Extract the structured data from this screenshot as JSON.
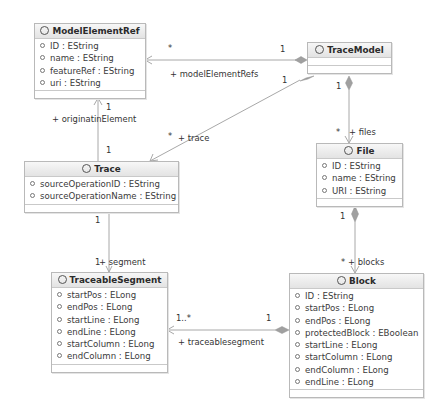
{
  "classes": {
    "modelElementRef": {
      "name": "ModelElementRef",
      "attributes": [
        "ID : EString",
        "name : EString",
        "featureRef : EString",
        "uri : EString"
      ]
    },
    "traceModel": {
      "name": "TraceModel",
      "attributes": []
    },
    "trace": {
      "name": "Trace",
      "attributes": [
        "sourceOperationID : EString",
        "sourceOperationName : EString"
      ]
    },
    "file": {
      "name": "File",
      "attributes": [
        "ID : EString",
        "name : EString",
        "URI : EString"
      ]
    },
    "traceableSegment": {
      "name": "TraceableSegment",
      "attributes": [
        "startPos : ELong",
        "endPos : ELong",
        "startLine : ELong",
        "endLine : ELong",
        "startColumn : ELong",
        "endColumn : ELong"
      ]
    },
    "block": {
      "name": "Block",
      "attributes": [
        "ID : EString",
        "startPos : ELong",
        "endPos : ELong",
        "protectedBlock : EBoolean",
        "startLine : ELong",
        "startColumn : ELong",
        "endColumn : ELong",
        "endLine : ELong"
      ]
    }
  },
  "associations": {
    "modelElementRefs": {
      "role": "+ modelElementRefs",
      "source_mult": "1",
      "target_mult": "*"
    },
    "trace": {
      "role": "+ trace",
      "source_mult": "1",
      "target_mult": "*"
    },
    "files": {
      "role": "+ files",
      "source_mult": "1",
      "target_mult": "*"
    },
    "originatinElement": {
      "role": "+ originatinElement",
      "source_mult": "1",
      "target_mult": "1"
    },
    "segment": {
      "role": "+ segment",
      "source_mult": "1",
      "target_mult": "1"
    },
    "blocks": {
      "role": "+ blocks",
      "source_mult": "1",
      "target_mult": "*"
    },
    "traceablesegment": {
      "role": "+ traceablesegment",
      "source_mult": "1",
      "target_mult": "1..*"
    }
  },
  "colors": {
    "line": "#a8a8a8",
    "diamond": "#a0a0a0",
    "header_top": "#f7f7f7",
    "header_bottom": "#e3e3e3",
    "border": "#b9b9b9"
  }
}
